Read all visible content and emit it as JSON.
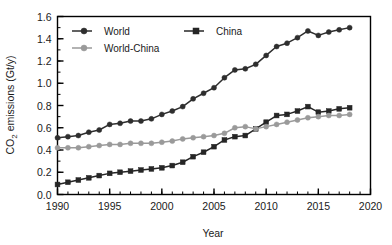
{
  "chart_data": {
    "type": "line",
    "title": "",
    "xlabel": "Year",
    "ylabel": "CO2 emissions (Gt/y)",
    "ylabel_display": "CO₂ emissions (Gt/y)",
    "xlim": [
      1990,
      2020
    ],
    "ylim": [
      0.0,
      1.6
    ],
    "grid": false,
    "legend_position": "top-left-inside",
    "x_major_ticks": [
      1990,
      1995,
      2000,
      2005,
      2010,
      2015,
      2020
    ],
    "x_tick_labels": [
      "1990",
      "1995",
      "2000",
      "2005",
      "2010",
      "2015",
      "2020"
    ],
    "x_minor_tick_step": 1,
    "y_major_ticks": [
      0.0,
      0.2,
      0.4,
      0.6,
      0.8,
      1.0,
      1.2,
      1.4,
      1.6
    ],
    "y_tick_labels": [
      "0.0",
      "0.2",
      "0.4",
      "0.6",
      "0.8",
      "1.0",
      "1.2",
      "1.4",
      "1.6"
    ],
    "y_minor_tick_step": 0.1,
    "x": [
      1990,
      1991,
      1992,
      1993,
      1994,
      1995,
      1996,
      1997,
      1998,
      1999,
      2000,
      2001,
      2002,
      2003,
      2004,
      2005,
      2006,
      2007,
      2008,
      2009,
      2010,
      2011,
      2012,
      2013,
      2014,
      2015,
      2016,
      2017,
      2018
    ],
    "series": [
      {
        "name": "World",
        "color": "#2e2e2e",
        "marker": "circle",
        "values": [
          0.51,
          0.52,
          0.53,
          0.56,
          0.58,
          0.63,
          0.64,
          0.66,
          0.66,
          0.68,
          0.72,
          0.75,
          0.79,
          0.86,
          0.91,
          0.96,
          1.05,
          1.12,
          1.13,
          1.17,
          1.25,
          1.33,
          1.36,
          1.41,
          1.47,
          1.43,
          1.46,
          1.48,
          1.5
        ]
      },
      {
        "name": "China",
        "color": "#262626",
        "marker": "square",
        "values": [
          0.09,
          0.11,
          0.13,
          0.15,
          0.17,
          0.19,
          0.2,
          0.21,
          0.22,
          0.23,
          0.24,
          0.26,
          0.29,
          0.34,
          0.38,
          0.43,
          0.49,
          0.52,
          0.53,
          0.59,
          0.65,
          0.71,
          0.72,
          0.75,
          0.79,
          0.74,
          0.75,
          0.77,
          0.78
        ]
      },
      {
        "name": "World-China",
        "color": "#9a9a9a",
        "marker": "circle",
        "values": [
          0.42,
          0.42,
          0.42,
          0.43,
          0.44,
          0.45,
          0.45,
          0.46,
          0.46,
          0.46,
          0.47,
          0.48,
          0.5,
          0.51,
          0.52,
          0.53,
          0.55,
          0.6,
          0.61,
          0.59,
          0.61,
          0.63,
          0.65,
          0.67,
          0.69,
          0.7,
          0.71,
          0.71,
          0.72
        ]
      }
    ],
    "legend": [
      {
        "name": "World",
        "color": "#2e2e2e",
        "marker": "circle"
      },
      {
        "name": "China",
        "color": "#262626",
        "marker": "square"
      },
      {
        "name": "World-China",
        "color": "#9a9a9a",
        "marker": "circle"
      }
    ]
  }
}
